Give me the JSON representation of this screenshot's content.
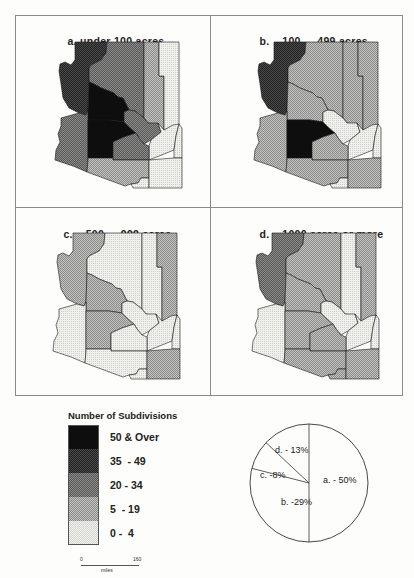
{
  "panels": [
    {
      "id": "a",
      "letter": "a.",
      "title": "under 100 acres",
      "fills": {
        "mohave": 3,
        "coconino": 2,
        "navajo": 1,
        "apache": 0,
        "yavapai": 4,
        "yuma": 2,
        "maricopa": 4,
        "gila": 2,
        "pinal": 2,
        "graham": 0,
        "greenlee": 0,
        "pima": 1,
        "cochise": 0,
        "santacruz": 0
      }
    },
    {
      "id": "b",
      "letter": "b.",
      "title": "100  -  499 acres",
      "fills": {
        "mohave": 3,
        "coconino": 1,
        "navajo": 1,
        "apache": 1,
        "yavapai": 1,
        "yuma": 1,
        "maricopa": 4,
        "gila": 0,
        "pinal": 1,
        "graham": 0,
        "greenlee": 0,
        "pima": 1,
        "cochise": 1,
        "santacruz": 0
      }
    },
    {
      "id": "c",
      "letter": "c.",
      "title": "500  -  999 acres",
      "fills": {
        "mohave": 1,
        "coconino": 0,
        "navajo": 0,
        "apache": 1,
        "yavapai": 1,
        "yuma": 0,
        "maricopa": 1,
        "gila": 0,
        "pinal": 0,
        "graham": 0,
        "greenlee": 0,
        "pima": 0,
        "cochise": 1,
        "santacruz": 0
      }
    },
    {
      "id": "d",
      "letter": "d.",
      "title": "1000 acres or more",
      "fills": {
        "mohave": 2,
        "coconino": 1,
        "navajo": 0,
        "apache": 1,
        "yavapai": 1,
        "yuma": 0,
        "maricopa": 1,
        "gila": 0,
        "pinal": 1,
        "graham": 0,
        "greenlee": 0,
        "pima": 1,
        "cochise": 1,
        "santacruz": 1
      }
    }
  ],
  "legend": {
    "title": "Number of Subdivisions",
    "classes": [
      {
        "label": "50 & Over",
        "level": 4,
        "color": "#0d0d0d"
      },
      {
        "label": "35  - 49",
        "level": 3,
        "color": "#3a3a3a"
      },
      {
        "label": "20 - 34",
        "level": 2,
        "color": "#6e6e6e"
      },
      {
        "label": "5  - 19",
        "level": 1,
        "color": "#a8a8a8"
      },
      {
        "label": "0 -  4",
        "level": 0,
        "color": "#e8e8e4"
      }
    ]
  },
  "scale": {
    "start": "0",
    "end": "160",
    "unit": "miles"
  },
  "chart_data": {
    "type": "pie",
    "title": "",
    "categories": [
      "a. under 100 acres",
      "b. 100 - 499 acres",
      "c. 500 - 999 acres",
      "d. 1000 acres or more"
    ],
    "values": [
      50,
      29,
      8,
      13
    ],
    "labels": [
      "a. - 50%",
      "b. -29%",
      "c. -8%",
      "d. - 13%"
    ],
    "start_angle_deg": 0,
    "direction": "clockwise"
  },
  "pie_labels": {
    "a": "a. - 50%",
    "b": "b. -29%",
    "c": "c. -8%",
    "d": "d. - 13%"
  }
}
